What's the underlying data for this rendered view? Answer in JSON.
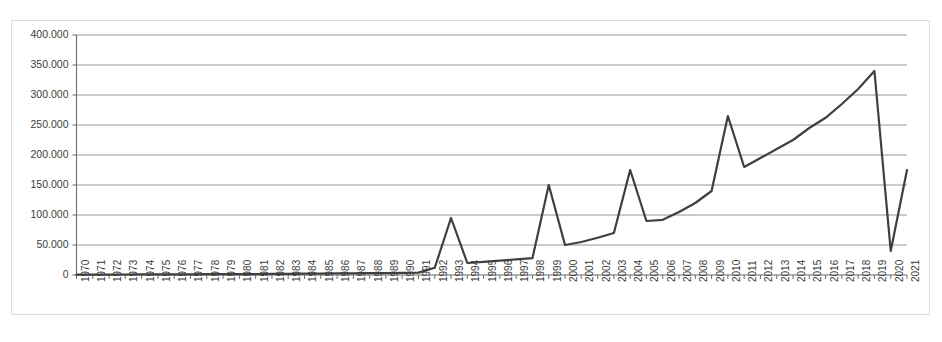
{
  "chart_data": {
    "type": "line",
    "title": "",
    "subtitle": "",
    "xlabel": "",
    "ylabel": "",
    "legend": [],
    "legend_position": "none",
    "grid": true,
    "grid_axis": "y",
    "xlim_categories": [
      "1970",
      "2021"
    ],
    "ylim": [
      0,
      400000
    ],
    "ytick_step": 50000,
    "ytick_labels": [
      "0",
      "50.000",
      "100.000",
      "150.000",
      "200.000",
      "250.000",
      "300.000",
      "350.000",
      "400.000"
    ],
    "ytick_values": [
      0,
      50000,
      100000,
      150000,
      200000,
      250000,
      300000,
      350000,
      400000
    ],
    "line_color": "#3f3f3f",
    "line_width": 2.2,
    "markers": false,
    "categories": [
      "1970",
      "1971",
      "1972",
      "1973",
      "1974",
      "1975",
      "1976",
      "1977",
      "1978",
      "1979",
      "1980",
      "1981",
      "1982",
      "1983",
      "1984",
      "1985",
      "1986",
      "1987",
      "1988",
      "1989",
      "1990",
      "1991",
      "1992",
      "1993",
      "1994",
      "1995",
      "1996",
      "1997",
      "1998",
      "1999",
      "2000",
      "2001",
      "2002",
      "2003",
      "2004",
      "2005",
      "2006",
      "2007",
      "2008",
      "2009",
      "2010",
      "2011",
      "2012",
      "2013",
      "2014",
      "2015",
      "2016",
      "2017",
      "2018",
      "2019",
      "2020",
      "2021"
    ],
    "values": [
      500,
      600,
      700,
      800,
      900,
      1000,
      1100,
      1200,
      1300,
      1400,
      1500,
      1600,
      1800,
      2000,
      2200,
      2400,
      2600,
      2800,
      3000,
      3200,
      3500,
      4000,
      12000,
      95000,
      20000,
      22000,
      24000,
      26000,
      28000,
      150000,
      50000,
      55000,
      62000,
      70000,
      175000,
      90000,
      92000,
      105000,
      120000,
      140000,
      265000,
      180000,
      195000,
      210000,
      225000,
      245000,
      262000,
      285000,
      310000,
      340000,
      40000,
      175000
    ],
    "annotations": []
  },
  "axis": {
    "y_ticks": [
      {
        "label": "400.000",
        "value": 400000
      },
      {
        "label": "350.000",
        "value": 350000
      },
      {
        "label": "300.000",
        "value": 300000
      },
      {
        "label": "250.000",
        "value": 250000
      },
      {
        "label": "200.000",
        "value": 200000
      },
      {
        "label": "150.000",
        "value": 150000
      },
      {
        "label": "100.000",
        "value": 100000
      },
      {
        "label": "50.000",
        "value": 50000
      },
      {
        "label": "0",
        "value": 0
      }
    ]
  }
}
